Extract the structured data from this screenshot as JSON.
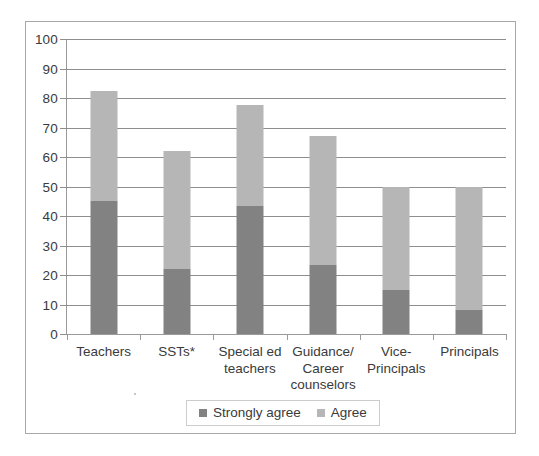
{
  "chart_data": {
    "type": "bar",
    "subtype": "stacked-vertical",
    "title": "",
    "xlabel": "",
    "ylabel": "",
    "ylim": [
      0,
      100
    ],
    "ytick_step": 10,
    "yticks": [
      0,
      10,
      20,
      30,
      40,
      50,
      60,
      70,
      80,
      90,
      100
    ],
    "grid": true,
    "legend_position": "bottom-center",
    "categories": [
      "Teachers",
      "SSTs*",
      "Special ed\nteachers",
      "Guidance/\nCareer\ncounselors",
      "Vice-\nPrincipals",
      "Principals"
    ],
    "series": [
      {
        "name": "Strongly agree",
        "color": "#828282",
        "values": [
          45,
          22,
          43.5,
          23.5,
          15,
          8
        ]
      },
      {
        "name": "Agree",
        "color": "#b6b6b6",
        "values": [
          37.5,
          40,
          34,
          43.5,
          35,
          42
        ]
      }
    ],
    "totals": [
      82.5,
      62,
      77.5,
      67,
      50,
      50
    ]
  },
  "axis": {
    "y_tick_labels": [
      "100",
      "90",
      "80",
      "70",
      "60",
      "50",
      "40",
      "30",
      "20",
      "10",
      "0"
    ]
  },
  "legend": {
    "entries": [
      {
        "label": "Strongly agree",
        "swatch": "strongly-agree-swatch"
      },
      {
        "label": "Agree",
        "swatch": "agree-swatch"
      }
    ]
  }
}
